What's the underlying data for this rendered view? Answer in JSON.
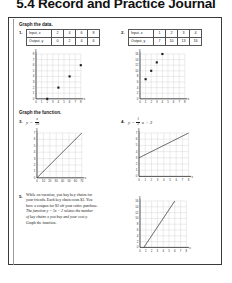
{
  "page": {
    "title": "5.4 Record and Practice Journal"
  },
  "sections": {
    "graph_the_data": "Graph the data.",
    "graph_the_function": "Graph the function."
  },
  "problems": [
    {
      "number": "1.",
      "table": {
        "row_labels": [
          "Input, x",
          "Output, y"
        ],
        "inputs": [
          "2",
          "4",
          "6",
          "8"
        ],
        "outputs": [
          "0",
          "2",
          "4",
          "6"
        ]
      },
      "graph": {
        "x_ticks": [
          "0",
          "1",
          "2",
          "3",
          "4",
          "5",
          "6",
          "7",
          "8"
        ],
        "y_ticks": [
          "0",
          "1",
          "2",
          "3",
          "4",
          "5",
          "6",
          "7",
          "8"
        ],
        "x_label": "x",
        "y_label": "y",
        "points": [
          [
            2,
            0
          ],
          [
            4,
            2
          ],
          [
            6,
            4
          ],
          [
            8,
            6
          ]
        ]
      }
    },
    {
      "number": "2.",
      "table": {
        "row_labels": [
          "Input, x",
          "Output, y"
        ],
        "inputs": [
          "1",
          "2",
          "3",
          "4"
        ],
        "outputs": [
          "7",
          "10",
          "13",
          "16"
        ]
      },
      "graph": {
        "x_ticks": [
          "0",
          "1",
          "2",
          "3",
          "4",
          "5",
          "6",
          "7",
          "8"
        ],
        "y_ticks": [
          "0",
          "2",
          "4",
          "6",
          "8",
          "10",
          "12",
          "14",
          "16"
        ],
        "x_label": "x",
        "y_label": "y",
        "points": [
          [
            1,
            7
          ],
          [
            2,
            10
          ],
          [
            3,
            13
          ],
          [
            4,
            16
          ]
        ]
      }
    },
    {
      "number": "3.",
      "equation": {
        "lhs": "y =",
        "numerator": "x",
        "denominator": "10"
      },
      "graph": {
        "x_ticks": [
          "0",
          "10",
          "20",
          "30",
          "40",
          "50",
          "60",
          "70"
        ],
        "y_ticks": [
          "0",
          "1",
          "2",
          "3",
          "4",
          "5",
          "6",
          "7"
        ],
        "x_label": "x",
        "y_label": "y",
        "line": {
          "slope": 0.1,
          "intercept": 0
        }
      }
    },
    {
      "number": "4.",
      "equation": {
        "lhs": "y =",
        "numerator": "1",
        "denominator": "2",
        "rhs": "x + 3"
      },
      "graph": {
        "x_ticks": [
          "0",
          "1",
          "2",
          "3",
          "4",
          "5",
          "6",
          "7",
          "8"
        ],
        "y_ticks": [
          "0",
          "1",
          "2",
          "3",
          "4",
          "5",
          "6",
          "7"
        ],
        "x_label": "x",
        "y_label": "y",
        "line": {
          "slope": 0.5,
          "intercept": 3
        }
      }
    },
    {
      "number": "5.",
      "text_line_1": "While on vacation, you buy key chains for",
      "text_line_2": "your friends. Each key chain costs $3. You",
      "text_line_3": "have a coupon for $2 off your entire purchase.",
      "text_line_4": "The function y = 3x − 2 relates the number",
      "text_line_5": "of key chains x you buy and your cost y.",
      "text_line_6": "Graph the function.",
      "graph": {
        "x_ticks": [
          "0",
          "1",
          "2",
          "3",
          "4",
          "5",
          "6",
          "7",
          "8"
        ],
        "y_ticks": [
          "0",
          "2",
          "4",
          "6",
          "8",
          "10",
          "12",
          "14",
          "16"
        ],
        "x_label": "x",
        "y_label": "y",
        "line": {
          "slope": 3,
          "intercept": -2
        }
      }
    }
  ]
}
